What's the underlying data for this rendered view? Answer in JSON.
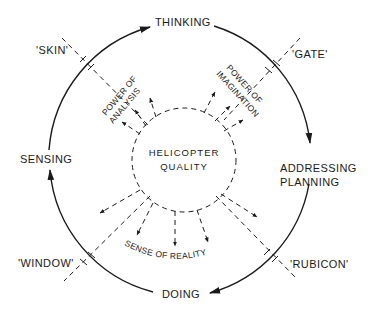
{
  "diagram": {
    "stages": {
      "top": "THINKING",
      "right_line1": "ADDRESSING",
      "right_line2": "PLANNING",
      "bottom": "DOING",
      "left": "SENSING"
    },
    "thresholds": {
      "top_left": "'SKIN'",
      "top_right": "'GATE'",
      "bottom_right": "'RUBICON'",
      "bottom_left": "'WINDOW'"
    },
    "center": {
      "line1": "HELICOPTER",
      "line2": "QUALITY"
    },
    "powers": {
      "analysis_line1": "POWER OF",
      "analysis_line2": "ANALYSIS",
      "imagination_line1": "POWER OF",
      "imagination_line2": "IMAGINATION",
      "reality": "SENSE OF REALITY"
    },
    "colors": {
      "ink": "#1a1a1a",
      "background": "#ffffff"
    }
  }
}
